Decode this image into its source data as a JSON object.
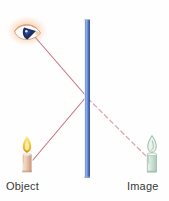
{
  "diagram": {
    "background_color": "#fefefe",
    "labels": {
      "object": "Object",
      "image": "Image"
    },
    "colors": {
      "mirror_edge": "#3a5fbf",
      "mirror_core": "#7fa4e8",
      "mirror_highlight": "#cfdffa",
      "ray_solid": "#c9737f",
      "ray_dashed": "#e0a4ad",
      "flame_outer": "#e8b020",
      "flame_inner": "#ffe07a",
      "candle_body": "#e8c9b0",
      "candle_body_shade": "#d2a98c",
      "image_candle": "#9dbfae",
      "eye_glow": "#f6c39a",
      "eye_pupil": "#1e2f63",
      "eye_white": "#fdfdfd",
      "label_text": "#3a3a3a"
    },
    "elements": {
      "mirror": {
        "name": "plane-mirror",
        "x": 85,
        "y_top": 19,
        "y_bottom": 178,
        "width": 5
      },
      "eye": {
        "name": "observer-eye",
        "cx": 27,
        "cy": 31
      },
      "object_candle": {
        "name": "object-candle",
        "cx": 27,
        "base_y": 172,
        "flame_tip_y": 135
      },
      "image_candle": {
        "name": "virtual-image-candle",
        "cx": 152,
        "base_y": 172,
        "flame_tip_y": 135
      },
      "reflection_point": {
        "name": "reflection-point",
        "x": 86,
        "y": 96
      },
      "rays": [
        {
          "name": "incident-ray",
          "style": "solid",
          "from": [
            33,
            160
          ],
          "to": [
            86,
            96
          ],
          "description": "Light from object to mirror"
        },
        {
          "name": "reflected-ray",
          "style": "solid",
          "from": [
            86,
            96
          ],
          "to": [
            36,
            37
          ],
          "description": "Reflected light from mirror to eye"
        },
        {
          "name": "virtual-ray",
          "style": "dashed",
          "from": [
            88,
            99
          ],
          "to": [
            146,
            156
          ],
          "description": "Apparent line of sight to virtual image"
        }
      ]
    }
  }
}
